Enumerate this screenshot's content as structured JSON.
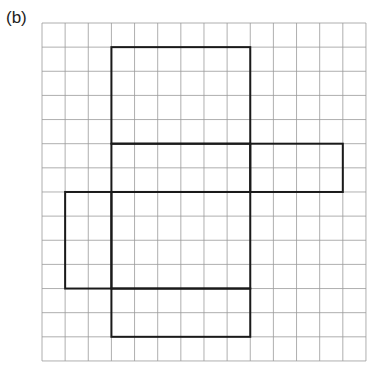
{
  "label": "(b)",
  "grid": {
    "cols": 14,
    "rows": 14,
    "origin_x": 42,
    "origin_y": 23,
    "cell_w": 23.14,
    "cell_h": 24.14,
    "line_color": "#9a9a9a",
    "shape_color": "#1a1a1a"
  },
  "net": {
    "description": "Net of a cuboid drawn on square grid",
    "faces": [
      {
        "name": "top-face",
        "col": 3,
        "row": 1,
        "w": 6,
        "h": 4
      },
      {
        "name": "front-face",
        "col": 3,
        "row": 5,
        "w": 6,
        "h": 2
      },
      {
        "name": "right-flap",
        "col": 9,
        "row": 5,
        "w": 4,
        "h": 2
      },
      {
        "name": "bottom-face",
        "col": 3,
        "row": 7,
        "w": 6,
        "h": 4
      },
      {
        "name": "left-flap",
        "col": 1,
        "row": 7,
        "w": 2,
        "h": 4
      },
      {
        "name": "back-face",
        "col": 3,
        "row": 11,
        "w": 6,
        "h": 2
      }
    ]
  }
}
